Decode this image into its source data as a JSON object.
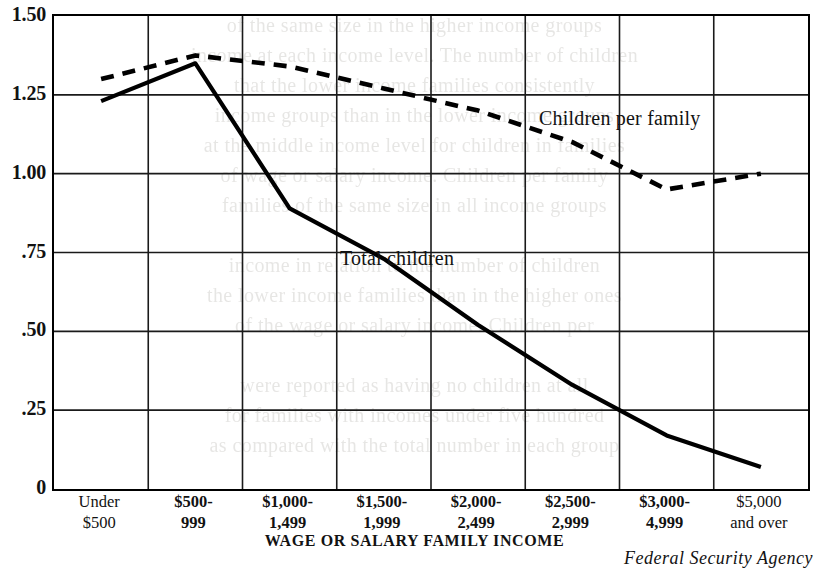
{
  "source_note": "Federal Security Agency",
  "ghost_text": [
    {
      "text": "of the same size in the higher income groups",
      "top": 14
    },
    {
      "text": "income at each income level. The number of children",
      "top": 44
    },
    {
      "text": "that the lower income families consistently",
      "top": 74
    },
    {
      "text": "income groups than in the lower income groups",
      "top": 104
    },
    {
      "text": "at the middle income level for children in families",
      "top": 134
    },
    {
      "text": "of wage or salary income. Children per family",
      "top": 164
    },
    {
      "text": "families of the same size in all income groups",
      "top": 194
    },
    {
      "text": "income in relation to the number of children",
      "top": 254
    },
    {
      "text": "the lower income families than in the higher ones",
      "top": 284
    },
    {
      "text": "of the wage or salary income. Children per",
      "top": 314
    },
    {
      "text": "were reported as having no children at all",
      "top": 374
    },
    {
      "text": "for families with incomes under five hundred",
      "top": 404
    },
    {
      "text": "as compared with the total number in each group",
      "top": 434
    }
  ],
  "chart_data": {
    "type": "line",
    "title": "",
    "xlabel": "WAGE OR SALARY FAMILY INCOME",
    "ylabel": "",
    "ylim": [
      0,
      1.5
    ],
    "grid": true,
    "legend": "inline-annotations",
    "categories": [
      {
        "line1": "Under",
        "line2": "$500"
      },
      {
        "line1": "$500-",
        "line2": "999"
      },
      {
        "line1": "$1,000-",
        "line2": "1,499"
      },
      {
        "line1": "$1,500-",
        "line2": "1,999"
      },
      {
        "line1": "$2,000-",
        "line2": "2,499"
      },
      {
        "line1": "$2,500-",
        "line2": "2,999"
      },
      {
        "line1": "$3,000-",
        "line2": "4,999"
      },
      {
        "line1": "$5,000",
        "line2": "and over"
      }
    ],
    "ytick_labels": [
      "1.50",
      "1.25",
      "1.00",
      ".75",
      ".50",
      ".25",
      "0"
    ],
    "ytick_values": [
      1.5,
      1.25,
      1.0,
      0.75,
      0.5,
      0.25,
      0
    ],
    "series": [
      {
        "name": "Children per family",
        "style": "dashed",
        "values": [
          1.3,
          1.375,
          1.34,
          1.27,
          1.2,
          1.1,
          0.95,
          1.0
        ]
      },
      {
        "name": "Total children",
        "style": "solid",
        "values": [
          1.23,
          1.35,
          0.89,
          0.73,
          0.52,
          0.33,
          0.17,
          0.19
        ]
      }
    ],
    "series_value_overrides": {
      "total_children_last_point": 0.07
    }
  }
}
